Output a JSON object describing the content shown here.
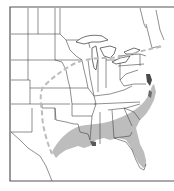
{
  "map": {
    "type": "range-map",
    "region": "Eastern United States",
    "colors": {
      "background": "#ffffff",
      "frame": "#555555",
      "state_lines": "#444444",
      "range_fill": "#bdbdbd",
      "range_dense": "#4a4a4a",
      "boundary_dash": "#bcbcbc"
    },
    "legend": {
      "shaded_area": "range-shaded-icon",
      "dashed_line": "range-boundary-dashed-icon"
    }
  }
}
